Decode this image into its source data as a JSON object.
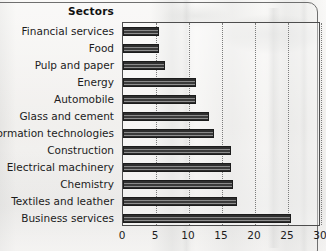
{
  "chart_data": {
    "type": "bar",
    "orientation": "horizontal",
    "title": "Sectors",
    "xlabel": "",
    "ylabel": "Sectors",
    "xlim": [
      0,
      30
    ],
    "xticks": [
      0,
      5,
      10,
      15,
      20,
      25,
      30
    ],
    "xtick_labels": [
      "0",
      "5",
      "10",
      "15",
      "20",
      "25",
      "30"
    ],
    "grid": "vertical-dotted",
    "legend": "none",
    "categories": [
      "Financial services",
      "Food",
      "Pulp and paper",
      "Energy",
      "Automobile",
      "Glass and cement",
      "Information technologies",
      "Construction",
      "Electrical machinery",
      "Chemistry",
      "Textiles and leather",
      "Business services"
    ],
    "values": [
      5.4,
      5.4,
      6.3,
      11.0,
      11.1,
      13.0,
      13.8,
      16.4,
      16.4,
      16.7,
      17.2,
      25.5
    ],
    "colors": {
      "bar_dark": "#2e2e2e",
      "bar_light": "#8a8a8a",
      "bar_outline": "#1c1c1c",
      "axis": "#4d4d4d",
      "gridline": "#7b7b7b",
      "text": "#1c1c1c",
      "plot_background": "#f3f2ef"
    }
  },
  "chart": {
    "header_label": "Sectors"
  }
}
